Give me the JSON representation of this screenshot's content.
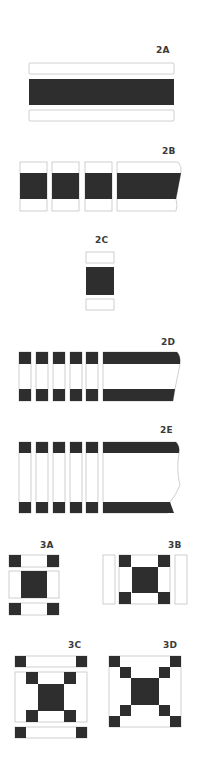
{
  "figures": [
    {
      "id": "2A",
      "label": "2A",
      "description": "Three strips: white, dark, white"
    },
    {
      "id": "2B",
      "label": "2B",
      "description": "Strip set cut into segments"
    },
    {
      "id": "2C",
      "label": "2C",
      "description": "Single segment separated into pieces"
    },
    {
      "id": "2D",
      "label": "2D",
      "description": "Dark-white-dark strip set cut into narrow segments"
    },
    {
      "id": "2E",
      "label": "2E",
      "description": "Wider dark-white-dark strip set cut into segments"
    },
    {
      "id": "3A",
      "label": "3A",
      "description": "Nine-patch rows assembled"
    },
    {
      "id": "3B",
      "label": "3B",
      "description": "Nine-patch with side strips"
    },
    {
      "id": "3C",
      "label": "3C",
      "description": "Center with top and bottom corner strips"
    },
    {
      "id": "3D",
      "label": "3D",
      "description": "Completed block"
    }
  ],
  "colors": {
    "dark": "#2e2e2e",
    "light": "#ffffff",
    "outline": "#c4c4c4",
    "label": "#3a3a3a"
  }
}
